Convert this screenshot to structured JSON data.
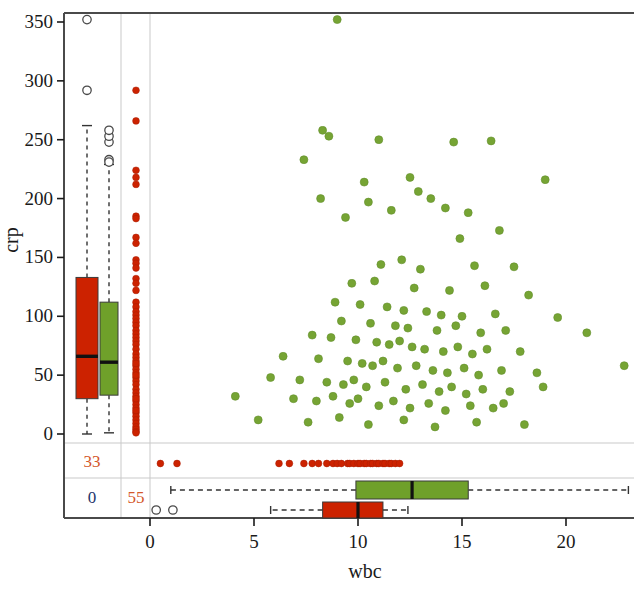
{
  "figure": {
    "title": "",
    "background_color": "#ffffff",
    "panel_border_color": "#4a4a4a",
    "grid_color": "#c9c9c9"
  },
  "axes": {
    "x": {
      "label": "wbc",
      "ticks": [
        0,
        5,
        10,
        15,
        20
      ],
      "tick_labels": [
        "0",
        "5",
        "10",
        "15",
        "20"
      ],
      "range": [
        -4.6,
        23.4
      ]
    },
    "y": {
      "label": "crp",
      "ticks": [
        0,
        50,
        100,
        150,
        200,
        250,
        300,
        350
      ],
      "tick_labels": [
        "0",
        "50",
        "100",
        "150",
        "200",
        "250",
        "300",
        "350"
      ],
      "range": [
        -6,
        364
      ]
    }
  },
  "colors": {
    "red": "#CC2200",
    "red_dark": "#B81E00",
    "green": "#6FA02A",
    "green_dark": "#567E1E",
    "outlier_stroke": "#4a4a4a",
    "count_orange": "#D4572A",
    "count_blue": "#23356B",
    "median_line": "#111111",
    "whisker": "#333333"
  },
  "missing_counts": {
    "crp_missing_red_label": "33",
    "crp_missing_blue_label": "0",
    "wbc_missing_red_label": "55"
  },
  "chart_data": {
    "type": "scatter",
    "title": "",
    "xlabel": "wbc",
    "ylabel": "crp",
    "xlim": [
      -4.6,
      23.4
    ],
    "ylim": [
      -6,
      364
    ],
    "grid": false,
    "legend": "none",
    "series": [
      {
        "name": "scatter-green",
        "color": "#6FA02A",
        "marker": "filled-circle",
        "points": [
          [
            9.0,
            352
          ],
          [
            8.3,
            258
          ],
          [
            8.6,
            253
          ],
          [
            11.0,
            250
          ],
          [
            14.6,
            248
          ],
          [
            16.4,
            249
          ],
          [
            7.4,
            233
          ],
          [
            19.0,
            216
          ],
          [
            12.5,
            218
          ],
          [
            10.3,
            214
          ],
          [
            12.9,
            206
          ],
          [
            8.2,
            200
          ],
          [
            10.5,
            197
          ],
          [
            13.5,
            200
          ],
          [
            14.2,
            192
          ],
          [
            9.4,
            184
          ],
          [
            11.6,
            190
          ],
          [
            15.3,
            188
          ],
          [
            14.9,
            166
          ],
          [
            16.8,
            173
          ],
          [
            12.1,
            148
          ],
          [
            11.1,
            144
          ],
          [
            13.0,
            140
          ],
          [
            15.6,
            143
          ],
          [
            17.5,
            142
          ],
          [
            9.7,
            128
          ],
          [
            10.8,
            130
          ],
          [
            12.7,
            124
          ],
          [
            14.4,
            122
          ],
          [
            16.1,
            126
          ],
          [
            18.2,
            118
          ],
          [
            8.9,
            112
          ],
          [
            10.1,
            110
          ],
          [
            11.4,
            108
          ],
          [
            12.2,
            105
          ],
          [
            13.3,
            104
          ],
          [
            14.0,
            101
          ],
          [
            15.0,
            100
          ],
          [
            16.6,
            102
          ],
          [
            19.6,
            99
          ],
          [
            9.2,
            96
          ],
          [
            10.6,
            94
          ],
          [
            11.8,
            92
          ],
          [
            12.4,
            90
          ],
          [
            13.8,
            88
          ],
          [
            14.7,
            92
          ],
          [
            15.9,
            86
          ],
          [
            17.1,
            88
          ],
          [
            21.0,
            86
          ],
          [
            7.8,
            84
          ],
          [
            8.7,
            82
          ],
          [
            9.9,
            80
          ],
          [
            10.9,
            78
          ],
          [
            11.5,
            76
          ],
          [
            12.0,
            79
          ],
          [
            12.6,
            74
          ],
          [
            13.2,
            72
          ],
          [
            14.1,
            70
          ],
          [
            14.8,
            74
          ],
          [
            15.5,
            68
          ],
          [
            16.2,
            72
          ],
          [
            17.8,
            70
          ],
          [
            6.4,
            66
          ],
          [
            8.1,
            64
          ],
          [
            9.5,
            62
          ],
          [
            10.2,
            60
          ],
          [
            10.7,
            58
          ],
          [
            11.2,
            62
          ],
          [
            11.9,
            56
          ],
          [
            12.8,
            58
          ],
          [
            13.6,
            54
          ],
          [
            14.3,
            52
          ],
          [
            15.1,
            56
          ],
          [
            15.8,
            50
          ],
          [
            16.9,
            54
          ],
          [
            18.6,
            52
          ],
          [
            22.8,
            58
          ],
          [
            5.8,
            48
          ],
          [
            7.2,
            46
          ],
          [
            8.5,
            44
          ],
          [
            9.3,
            42
          ],
          [
            9.8,
            46
          ],
          [
            10.4,
            40
          ],
          [
            11.3,
            44
          ],
          [
            12.3,
            38
          ],
          [
            13.1,
            42
          ],
          [
            13.9,
            36
          ],
          [
            14.5,
            40
          ],
          [
            15.2,
            34
          ],
          [
            16.0,
            38
          ],
          [
            17.3,
            36
          ],
          [
            18.9,
            40
          ],
          [
            4.1,
            32
          ],
          [
            6.9,
            30
          ],
          [
            8.0,
            28
          ],
          [
            8.8,
            32
          ],
          [
            9.6,
            26
          ],
          [
            10.0,
            30
          ],
          [
            11.0,
            24
          ],
          [
            11.7,
            28
          ],
          [
            12.5,
            22
          ],
          [
            13.4,
            26
          ],
          [
            14.2,
            20
          ],
          [
            15.4,
            24
          ],
          [
            16.5,
            22
          ],
          [
            17.0,
            26
          ],
          [
            5.2,
            12
          ],
          [
            7.6,
            10
          ],
          [
            9.1,
            14
          ],
          [
            10.5,
            8
          ],
          [
            12.2,
            12
          ],
          [
            13.7,
            6
          ],
          [
            15.7,
            10
          ],
          [
            18.0,
            8
          ]
        ]
      },
      {
        "name": "crp-strip-red",
        "color": "#CC2200",
        "marker": "filled-circle",
        "description": "1D strip of crp values (wbc missing), drawn at the left margin column",
        "values": [
          292,
          266,
          224,
          218,
          212,
          185,
          183,
          167,
          162,
          148,
          145,
          141,
          132,
          128,
          122,
          112,
          108,
          104,
          101,
          98,
          95,
          92,
          88,
          85,
          82,
          79,
          76,
          72,
          68,
          65,
          62,
          58,
          55,
          52,
          48,
          45,
          42,
          38,
          35,
          32,
          28,
          25,
          22,
          18,
          15,
          12,
          9,
          6,
          4,
          2,
          1,
          20,
          30,
          50,
          60
        ]
      },
      {
        "name": "wbc-strip-red",
        "color": "#CC2200",
        "marker": "filled-circle",
        "description": "1D strip of wbc values (crp missing), drawn in the lower margin band",
        "values": [
          0.5,
          1.3,
          6.2,
          6.7,
          7.4,
          7.8,
          8.1,
          8.5,
          8.8,
          9.0,
          9.2,
          9.5,
          9.6,
          9.8,
          10.0,
          10.1,
          10.3,
          10.4,
          10.6,
          10.7,
          10.9,
          11.0,
          11.2,
          11.3,
          11.5,
          11.6,
          11.8,
          12.0
        ]
      },
      {
        "name": "wbc-strip-outliers",
        "color": "#ffffff",
        "marker": "open-circle",
        "description": "open-circle points in the both-missing band",
        "values": [
          0.3,
          1.1
        ]
      }
    ],
    "boxplots_vertical": [
      {
        "name": "crp-box-red",
        "color": "#CC2200",
        "axis": "crp",
        "lower_whisker": 0,
        "q1": 30,
        "median": 66,
        "q3": 133,
        "upper_whisker": 262,
        "outliers": [
          292,
          352
        ]
      },
      {
        "name": "crp-box-green",
        "color": "#6FA02A",
        "axis": "crp",
        "lower_whisker": 1,
        "q1": 33,
        "median": 61,
        "q3": 112,
        "upper_whisker": 229,
        "outliers": [
          233,
          231,
          248,
          253,
          258
        ]
      }
    ],
    "boxplots_horizontal": [
      {
        "name": "wbc-box-green",
        "color": "#6FA02A",
        "axis": "wbc",
        "lower_whisker": 1.0,
        "q1": 9.9,
        "median": 12.6,
        "q3": 15.3,
        "upper_whisker": 23.0,
        "outliers": []
      },
      {
        "name": "wbc-box-red",
        "color": "#CC2200",
        "axis": "wbc",
        "lower_whisker": 5.8,
        "q1": 8.3,
        "median": 10.0,
        "q3": 11.2,
        "upper_whisker": 12.4,
        "outliers": []
      }
    ]
  }
}
